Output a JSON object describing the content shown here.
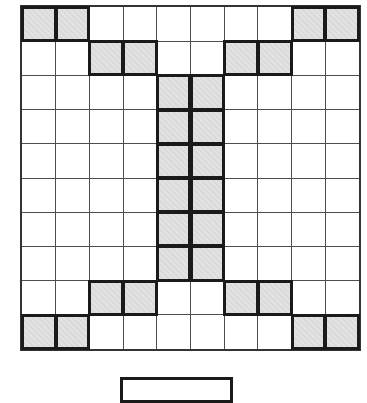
{
  "puzzle": {
    "description": "10 by 10 grid pattern puzzle; shaded squares form corner pairs, inner diagonal pairs, and a central two-column I shape; partially visible empty answer box below the grid",
    "grid": {
      "rows": 10,
      "cols": 10,
      "shaded_cells": [
        [
          0,
          0
        ],
        [
          0,
          1
        ],
        [
          0,
          8
        ],
        [
          0,
          9
        ],
        [
          1,
          2
        ],
        [
          1,
          3
        ],
        [
          1,
          6
        ],
        [
          1,
          7
        ],
        [
          2,
          4
        ],
        [
          2,
          5
        ],
        [
          3,
          4
        ],
        [
          3,
          5
        ],
        [
          4,
          4
        ],
        [
          4,
          5
        ],
        [
          5,
          4
        ],
        [
          5,
          5
        ],
        [
          6,
          4
        ],
        [
          6,
          5
        ],
        [
          7,
          4
        ],
        [
          7,
          5
        ],
        [
          8,
          2
        ],
        [
          8,
          3
        ],
        [
          8,
          6
        ],
        [
          8,
          7
        ],
        [
          9,
          0
        ],
        [
          9,
          1
        ],
        [
          9,
          8
        ],
        [
          9,
          9
        ]
      ],
      "colors": {
        "background": "#ffffff",
        "shaded_fill": "#e2e2e2",
        "shaded_fill_texture": "#dadada",
        "shaded_border": "#1a1a1a",
        "grid_line": "#4d4d4d",
        "frame": "#333333"
      }
    },
    "answer_box": {
      "border_color": "#1a1a1a",
      "fill": "#ffffff"
    }
  }
}
